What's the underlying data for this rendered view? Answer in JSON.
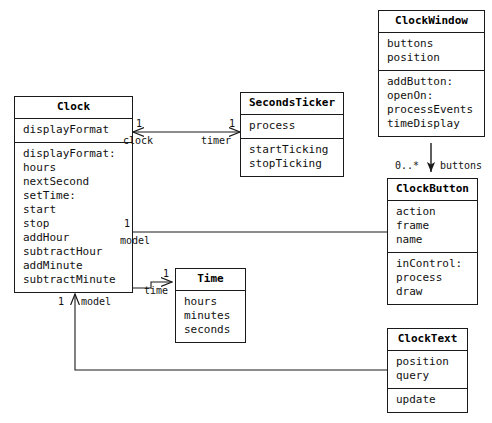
{
  "diagram": {
    "classes": [
      {
        "id": "clock",
        "name": "Clock",
        "attributes": [
          "displayFormat"
        ],
        "operations": [
          "displayFormat:",
          "hours",
          "nextSecond",
          "setTime:",
          "start",
          "stop",
          "addHour",
          "subtractHour",
          "addMinute",
          "subtractMinute"
        ]
      },
      {
        "id": "secondsticker",
        "name": "SecondsTicker",
        "attributes": [
          "process"
        ],
        "operations": [
          "startTicking",
          "stopTicking"
        ]
      },
      {
        "id": "clockwindow",
        "name": "ClockWindow",
        "attributes": [
          "buttons",
          "position"
        ],
        "operations": [
          "addButton:",
          "openOn:",
          "processEvents",
          "timeDisplay"
        ]
      },
      {
        "id": "clockbutton",
        "name": "ClockButton",
        "attributes": [
          "action",
          "frame",
          "name"
        ],
        "operations": [
          "inControl:",
          "process",
          "draw"
        ]
      },
      {
        "id": "time",
        "name": "Time",
        "attributes": [
          "hours",
          "minutes",
          "seconds"
        ],
        "operations": []
      },
      {
        "id": "clocktext",
        "name": "ClockText",
        "attributes": [
          "position",
          "query"
        ],
        "operations": [
          "update"
        ]
      }
    ],
    "edge_labels": [
      {
        "id": "clock-mult-ticker",
        "text": "1"
      },
      {
        "id": "clock-role-clock",
        "text": "clock"
      },
      {
        "id": "ticker-mult",
        "text": "1"
      },
      {
        "id": "ticker-role-timer",
        "text": "timer"
      },
      {
        "id": "button-model-mult",
        "text": "1"
      },
      {
        "id": "button-model-role",
        "text": "model"
      },
      {
        "id": "time-mult",
        "text": "1"
      },
      {
        "id": "time-role",
        "text": "time"
      },
      {
        "id": "text-model-mult",
        "text": "1"
      },
      {
        "id": "text-model-role",
        "text": "model"
      },
      {
        "id": "buttons-mult",
        "text": "0..*"
      },
      {
        "id": "buttons-role",
        "text": "buttons"
      }
    ],
    "colors": {
      "line": "#1a1a1a",
      "text": "#111111",
      "background": "#ffffff"
    }
  }
}
